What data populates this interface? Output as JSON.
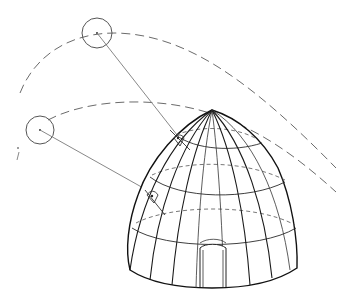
{
  "figure": {
    "colors": {
      "background": "#ffffff",
      "ink": "#111111",
      "sunpath": "#6b6b6b",
      "ray": "#7a7a7a"
    },
    "sun_positions": [
      {
        "label": "sun-high",
        "cx": 97,
        "cy": 33,
        "r": 15
      },
      {
        "label": "sun-low",
        "cx": 40,
        "cy": 130,
        "r": 14
      }
    ],
    "sun_paths": [
      {
        "label": "upper-sun-path"
      },
      {
        "label": "lower-sun-path"
      }
    ],
    "dome": {
      "apex": [
        212,
        110
      ],
      "base_y": 287,
      "left_x": 128,
      "right_x": 297,
      "ribs": 10,
      "rings": 3
    }
  }
}
